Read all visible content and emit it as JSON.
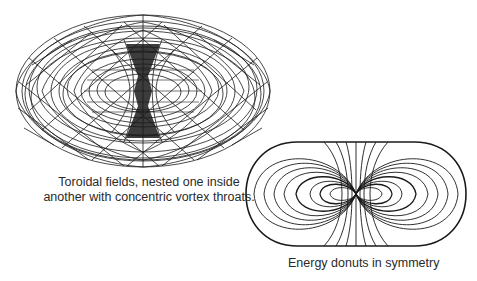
{
  "figures": [
    {
      "id": "toroidal-fields",
      "caption_lines": [
        "Toroidal fields, nested one inside",
        "another with concentric vortex throats."
      ]
    },
    {
      "id": "energy-donuts",
      "caption": "Energy donuts in symmetry"
    }
  ],
  "clipped_text": {
    "fragments": [
      "",
      "",
      "",
      ""
    ]
  },
  "colors": {
    "ink": "#1a1a1a",
    "background": "#ffffff"
  }
}
